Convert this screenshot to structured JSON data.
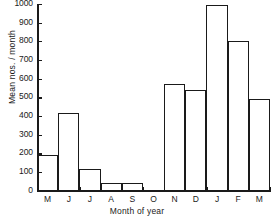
{
  "chart_data": {
    "type": "bar",
    "title": "",
    "xlabel": "Month of year",
    "ylabel": "Mean nos. / month",
    "categories": [
      "M",
      "J",
      "J",
      "A",
      "S",
      "O",
      "N",
      "D",
      "J",
      "F",
      "M"
    ],
    "values": [
      200,
      425,
      125,
      50,
      50,
      0,
      580,
      545,
      1000,
      810,
      500
    ],
    "ylim": [
      0,
      1000
    ],
    "yticks": [
      0,
      100,
      200,
      300,
      400,
      500,
      600,
      700,
      800,
      900,
      1000
    ],
    "ytick_labels": [
      "0",
      "100",
      "200",
      "300",
      "400",
      "500",
      "600",
      "700",
      "800",
      "900",
      "1000"
    ],
    "grid": false,
    "legend": null,
    "bar_fill": "#ffffff",
    "bar_edge": "#1a1a1a",
    "axis_color": "#1a1a1a",
    "background": "#ffffff"
  }
}
